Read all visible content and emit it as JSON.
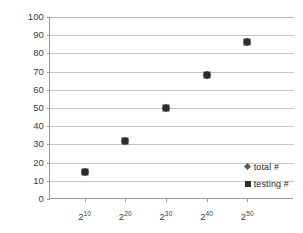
{
  "chart_data": {
    "type": "scatter",
    "title": "",
    "xlabel": "",
    "ylabel": "",
    "ylim": [
      0,
      100
    ],
    "ytick_labels": [
      "100",
      "90",
      "80",
      "70",
      "60",
      "50",
      "40",
      "30",
      "20",
      "10",
      "0"
    ],
    "ytick_values": [
      100,
      90,
      80,
      70,
      60,
      50,
      40,
      30,
      20,
      10,
      0
    ],
    "categories": [
      "2^10",
      "2^20",
      "2^30",
      "2^40",
      "2^50"
    ],
    "xtick_base": "2",
    "xtick_exponents": [
      "10",
      "20",
      "30",
      "40",
      "50"
    ],
    "grid": "horizontal",
    "legend_position": "inside-bottom-right",
    "series": [
      {
        "name": "total #",
        "marker": "diamond",
        "color": "#4a4a4a",
        "values": [
          15,
          32,
          50,
          68,
          86
        ]
      },
      {
        "name": "testing #",
        "marker": "square",
        "color": "#2c2c2c",
        "values": [
          15,
          32,
          50,
          68,
          86
        ]
      }
    ]
  },
  "legend": {
    "items": [
      {
        "label": "total #",
        "marker_icon": "diamond-marker-icon"
      },
      {
        "label": "testing #",
        "marker_icon": "square-marker-icon"
      }
    ]
  }
}
